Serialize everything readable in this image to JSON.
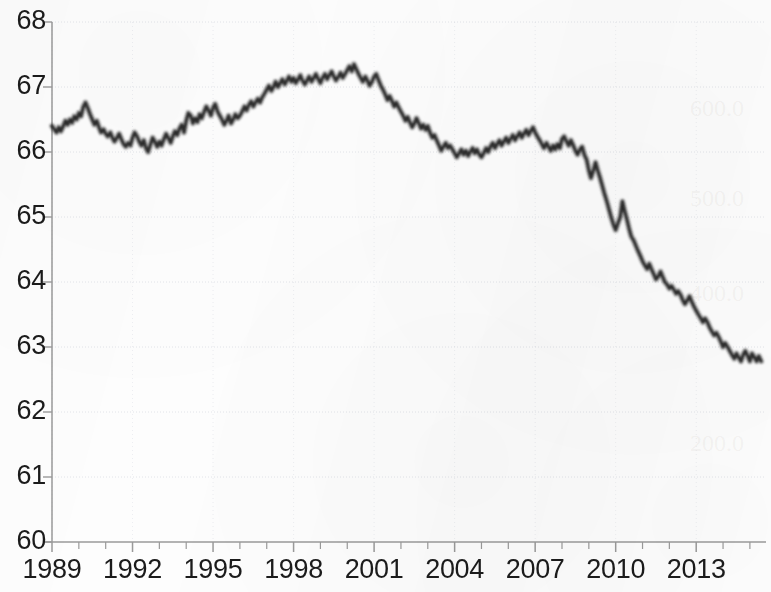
{
  "chart_data": {
    "type": "line",
    "title": "",
    "subtitle": "",
    "xlabel": "",
    "ylabel": "",
    "xlim": [
      1989.0,
      2015.6
    ],
    "ylim": [
      60,
      68
    ],
    "grid": true,
    "legend": "none",
    "line_color": "#2b2b2b",
    "axis_color": "#9a9a9a",
    "grid_color": "#d9dce3",
    "background_color": "#fdfdfd",
    "y_ticks": [
      "68",
      "67",
      "66",
      "65",
      "64",
      "63",
      "62",
      "61",
      "60"
    ],
    "y_tick_values": [
      68,
      67,
      66,
      65,
      64,
      63,
      62,
      61,
      60
    ],
    "x_ticks": [
      "1989",
      "1992",
      "1995",
      "1998",
      "2001",
      "2004",
      "2007",
      "2010",
      "2013"
    ],
    "x_tick_values": [
      1989,
      1992,
      1995,
      1998,
      2001,
      2004,
      2007,
      2010,
      2013
    ],
    "x_minor_tick_interval": 1,
    "series": [
      {
        "name": "Labor force participation rate",
        "x": [
          1989.0,
          1989.08,
          1989.17,
          1989.25,
          1989.33,
          1989.42,
          1989.5,
          1989.58,
          1989.67,
          1989.75,
          1989.83,
          1989.92,
          1990.0,
          1990.08,
          1990.17,
          1990.25,
          1990.33,
          1990.42,
          1990.5,
          1990.58,
          1990.67,
          1990.75,
          1990.83,
          1990.92,
          1991.0,
          1991.08,
          1991.17,
          1991.25,
          1991.33,
          1991.42,
          1991.5,
          1991.58,
          1991.67,
          1991.75,
          1991.83,
          1991.92,
          1992.0,
          1992.08,
          1992.17,
          1992.25,
          1992.33,
          1992.42,
          1992.5,
          1992.58,
          1992.67,
          1992.75,
          1992.83,
          1992.92,
          1993.0,
          1993.08,
          1993.17,
          1993.25,
          1993.33,
          1993.42,
          1993.5,
          1993.58,
          1993.67,
          1993.75,
          1993.83,
          1993.92,
          1994.0,
          1994.08,
          1994.17,
          1994.25,
          1994.33,
          1994.42,
          1994.5,
          1994.58,
          1994.67,
          1994.75,
          1994.83,
          1994.92,
          1995.0,
          1995.08,
          1995.17,
          1995.25,
          1995.33,
          1995.42,
          1995.5,
          1995.58,
          1995.67,
          1995.75,
          1995.83,
          1995.92,
          1996.0,
          1996.08,
          1996.17,
          1996.25,
          1996.33,
          1996.42,
          1996.5,
          1996.58,
          1996.67,
          1996.75,
          1996.83,
          1996.92,
          1997.0,
          1997.08,
          1997.17,
          1997.25,
          1997.33,
          1997.42,
          1997.5,
          1997.58,
          1997.67,
          1997.75,
          1997.83,
          1997.92,
          1998.0,
          1998.08,
          1998.17,
          1998.25,
          1998.33,
          1998.42,
          1998.5,
          1998.58,
          1998.67,
          1998.75,
          1998.83,
          1998.92,
          1999.0,
          1999.08,
          1999.17,
          1999.25,
          1999.33,
          1999.42,
          1999.5,
          1999.58,
          1999.67,
          1999.75,
          1999.83,
          1999.92,
          2000.0,
          2000.08,
          2000.17,
          2000.25,
          2000.33,
          2000.42,
          2000.5,
          2000.58,
          2000.67,
          2000.75,
          2000.83,
          2000.92,
          2001.0,
          2001.08,
          2001.17,
          2001.25,
          2001.33,
          2001.42,
          2001.5,
          2001.58,
          2001.67,
          2001.75,
          2001.83,
          2001.92,
          2002.0,
          2002.08,
          2002.17,
          2002.25,
          2002.33,
          2002.42,
          2002.5,
          2002.58,
          2002.67,
          2002.75,
          2002.83,
          2002.92,
          2003.0,
          2003.08,
          2003.17,
          2003.25,
          2003.33,
          2003.42,
          2003.5,
          2003.58,
          2003.67,
          2003.75,
          2003.83,
          2003.92,
          2004.0,
          2004.08,
          2004.17,
          2004.25,
          2004.33,
          2004.42,
          2004.5,
          2004.58,
          2004.67,
          2004.75,
          2004.83,
          2004.92,
          2005.0,
          2005.08,
          2005.17,
          2005.25,
          2005.33,
          2005.42,
          2005.5,
          2005.58,
          2005.67,
          2005.75,
          2005.83,
          2005.92,
          2006.0,
          2006.08,
          2006.17,
          2006.25,
          2006.33,
          2006.42,
          2006.5,
          2006.58,
          2006.67,
          2006.75,
          2006.83,
          2006.92,
          2007.0,
          2007.08,
          2007.17,
          2007.25,
          2007.33,
          2007.42,
          2007.5,
          2007.58,
          2007.67,
          2007.75,
          2007.83,
          2007.92,
          2008.0,
          2008.08,
          2008.17,
          2008.25,
          2008.33,
          2008.42,
          2008.5,
          2008.58,
          2008.67,
          2008.75,
          2008.83,
          2008.92,
          2009.0,
          2009.08,
          2009.17,
          2009.25,
          2009.33,
          2009.42,
          2009.5,
          2009.58,
          2009.67,
          2009.75,
          2009.83,
          2009.92,
          2010.0,
          2010.08,
          2010.17,
          2010.25,
          2010.33,
          2010.42,
          2010.5,
          2010.58,
          2010.67,
          2010.75,
          2010.83,
          2010.92,
          2011.0,
          2011.08,
          2011.17,
          2011.25,
          2011.33,
          2011.42,
          2011.5,
          2011.58,
          2011.67,
          2011.75,
          2011.83,
          2011.92,
          2012.0,
          2012.08,
          2012.17,
          2012.25,
          2012.33,
          2012.42,
          2012.5,
          2012.58,
          2012.67,
          2012.75,
          2012.83,
          2012.92,
          2013.0,
          2013.08,
          2013.17,
          2013.25,
          2013.33,
          2013.42,
          2013.5,
          2013.58,
          2013.67,
          2013.75,
          2013.83,
          2013.92,
          2014.0,
          2014.08,
          2014.17,
          2014.25,
          2014.33,
          2014.42,
          2014.5,
          2014.58,
          2014.67,
          2014.75,
          2014.83,
          2014.92,
          2015.0,
          2015.08,
          2015.17,
          2015.25,
          2015.33,
          2015.42
        ],
        "y": [
          66.4,
          66.35,
          66.3,
          66.38,
          66.32,
          66.4,
          66.48,
          66.42,
          66.5,
          66.45,
          66.55,
          66.5,
          66.6,
          66.55,
          66.7,
          66.76,
          66.68,
          66.58,
          66.5,
          66.42,
          66.48,
          66.38,
          66.3,
          66.35,
          66.28,
          66.24,
          66.3,
          66.22,
          66.16,
          66.22,
          66.28,
          66.2,
          66.12,
          66.08,
          66.14,
          66.1,
          66.22,
          66.3,
          66.24,
          66.16,
          66.1,
          66.18,
          66.06,
          66.0,
          66.12,
          66.22,
          66.16,
          66.08,
          66.16,
          66.1,
          66.2,
          66.28,
          66.22,
          66.14,
          66.24,
          66.32,
          66.26,
          66.36,
          66.42,
          66.3,
          66.48,
          66.6,
          66.56,
          66.44,
          66.52,
          66.46,
          66.58,
          66.52,
          66.62,
          66.7,
          66.64,
          66.56,
          66.68,
          66.74,
          66.62,
          66.56,
          66.5,
          66.42,
          66.48,
          66.56,
          66.44,
          66.5,
          66.58,
          66.52,
          66.56,
          66.62,
          66.7,
          66.64,
          66.72,
          66.78,
          66.7,
          66.76,
          66.82,
          66.76,
          66.84,
          66.9,
          66.96,
          67.02,
          66.94,
          67.0,
          67.08,
          67.0,
          67.06,
          67.12,
          67.04,
          67.1,
          67.16,
          67.08,
          67.14,
          67.06,
          67.12,
          67.18,
          67.1,
          67.04,
          67.1,
          67.16,
          67.08,
          67.14,
          67.2,
          67.12,
          67.06,
          67.14,
          67.2,
          67.12,
          67.18,
          67.24,
          67.16,
          67.1,
          67.16,
          67.22,
          67.14,
          67.2,
          67.26,
          67.32,
          67.24,
          67.35,
          67.28,
          67.2,
          67.14,
          67.08,
          67.16,
          67.1,
          67.02,
          67.08,
          67.16,
          67.2,
          67.1,
          67.02,
          66.96,
          66.88,
          66.8,
          66.86,
          66.78,
          66.7,
          66.76,
          66.68,
          66.62,
          66.56,
          66.48,
          66.54,
          66.46,
          66.38,
          66.44,
          66.52,
          66.44,
          66.36,
          66.42,
          66.34,
          66.4,
          66.3,
          66.22,
          66.26,
          66.18,
          66.1,
          66.02,
          66.08,
          66.14,
          66.06,
          66.1,
          66.04,
          65.98,
          65.92,
          65.98,
          66.04,
          65.96,
          66.02,
          65.94,
          66.0,
          66.06,
          65.98,
          66.04,
          65.96,
          65.92,
          65.98,
          66.06,
          66.0,
          66.08,
          66.14,
          66.06,
          66.12,
          66.18,
          66.1,
          66.16,
          66.22,
          66.14,
          66.2,
          66.26,
          66.18,
          66.24,
          66.3,
          66.22,
          66.28,
          66.34,
          66.26,
          66.32,
          66.38,
          66.3,
          66.24,
          66.18,
          66.12,
          66.06,
          66.14,
          66.08,
          66.02,
          66.1,
          66.04,
          66.12,
          66.06,
          66.2,
          66.24,
          66.16,
          66.1,
          66.18,
          66.1,
          66.02,
          65.96,
          66.04,
          66.08,
          65.96,
          65.88,
          65.72,
          65.6,
          65.72,
          65.84,
          65.72,
          65.6,
          65.48,
          65.36,
          65.24,
          65.12,
          65.0,
          64.88,
          64.8,
          64.9,
          65.0,
          65.24,
          65.1,
          64.96,
          64.82,
          64.7,
          64.64,
          64.56,
          64.48,
          64.4,
          64.32,
          64.26,
          64.2,
          64.28,
          64.2,
          64.12,
          64.04,
          64.08,
          64.16,
          64.08,
          64.0,
          63.96,
          63.9,
          63.94,
          63.88,
          63.82,
          63.86,
          63.8,
          63.72,
          63.66,
          63.72,
          63.78,
          63.7,
          63.62,
          63.56,
          63.5,
          63.44,
          63.38,
          63.44,
          63.38,
          63.3,
          63.24,
          63.18,
          63.22,
          63.16,
          63.08,
          63.0,
          63.06,
          63.0,
          62.94,
          62.88,
          62.82,
          62.9,
          62.84,
          62.78,
          62.88,
          62.94,
          62.86,
          62.78,
          62.9,
          62.84,
          62.78,
          62.86,
          62.78
        ]
      }
    ]
  },
  "ghost_marks": [
    {
      "text": "",
      "x": 0,
      "y": 0
    }
  ]
}
